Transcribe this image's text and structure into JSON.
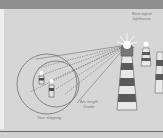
{
  "figure": {
    "labels": {
      "best_signal": [
        "Best signal",
        "lighthouse"
      ],
      "arc": [
        "Arc length",
        "Divide"
      ],
      "your_shipping": "Your shipping"
    },
    "colors": {
      "background": "#d6d6d6",
      "top_band": "#8e8e8e",
      "stripe_dark": "#5a5a5a",
      "stripe_light": "#e8e8e8",
      "line": "#707070"
    }
  }
}
